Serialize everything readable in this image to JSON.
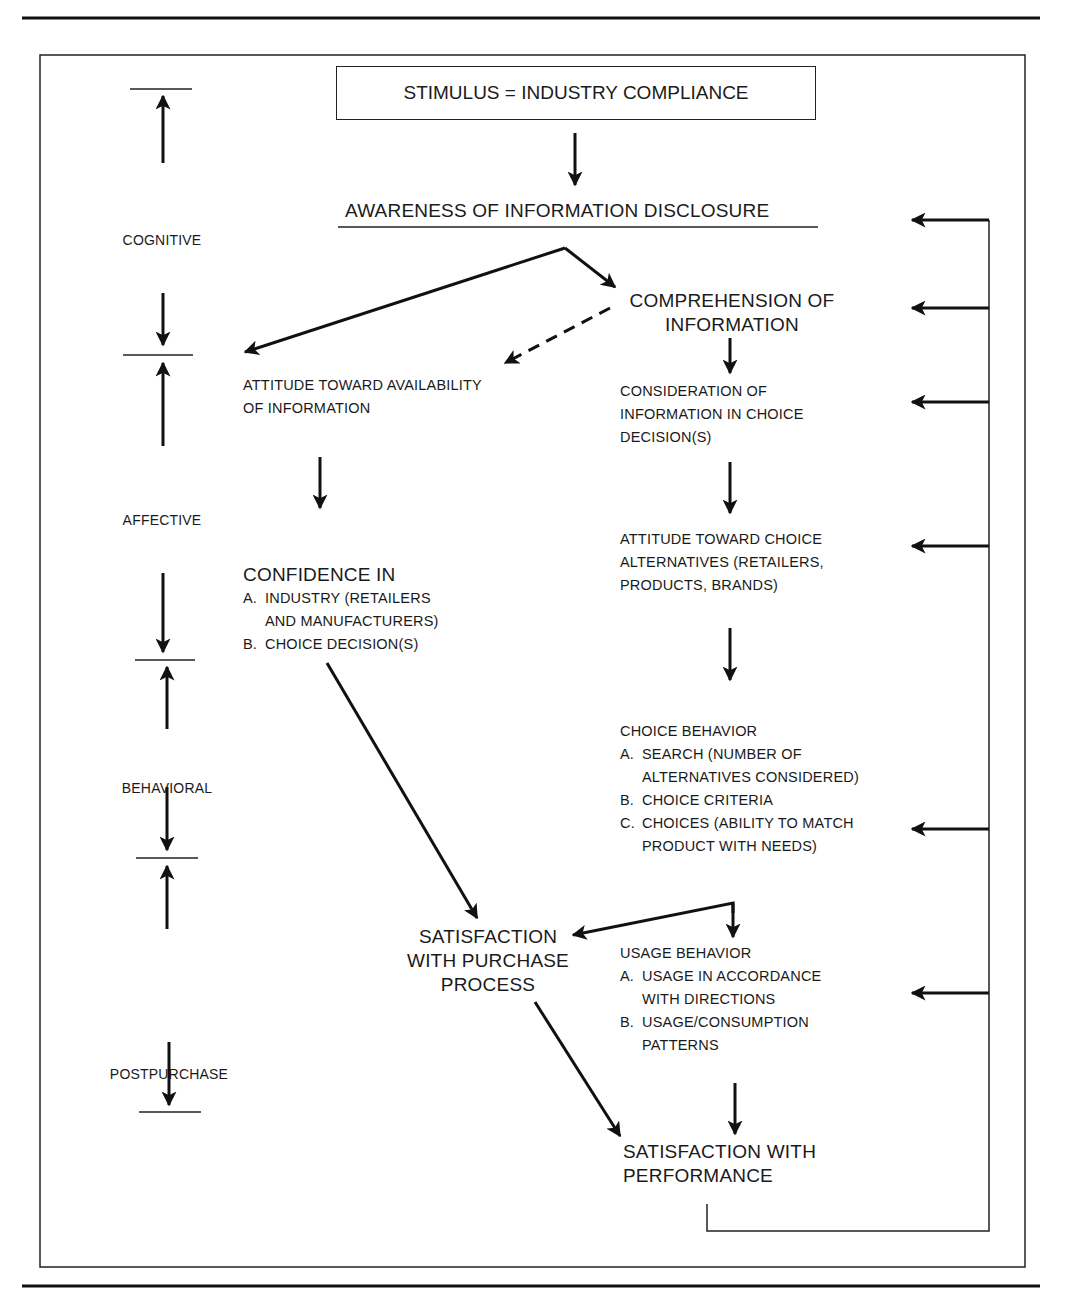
{
  "figure": {
    "stimulus": "STIMULUS = INDUSTRY COMPLIANCE",
    "awareness": "AWARENESS OF INFORMATION DISCLOSURE",
    "comprehension": [
      "COMPREHENSION OF",
      "INFORMATION"
    ],
    "attitude_availability": [
      "ATTITUDE TOWARD AVAILABILITY",
      "OF INFORMATION"
    ],
    "consideration": [
      "CONSIDERATION OF",
      "INFORMATION IN CHOICE",
      "DECISION(S)"
    ],
    "attitude_choice": [
      "ATTITUDE TOWARD CHOICE",
      "ALTERNATIVES (RETAILERS,",
      "PRODUCTS, BRANDS)"
    ],
    "confidence": {
      "title": "CONFIDENCE IN",
      "items": [
        {
          "marker": "A.",
          "lines": [
            "INDUSTRY (RETAILERS",
            "AND MANUFACTURERS)"
          ]
        },
        {
          "marker": "B.",
          "lines": [
            "CHOICE DECISION(S)"
          ]
        }
      ]
    },
    "choice_behavior": {
      "title": "CHOICE BEHAVIOR",
      "items": [
        {
          "marker": "A.",
          "lines": [
            "SEARCH (NUMBER OF",
            "ALTERNATIVES CONSIDERED)"
          ]
        },
        {
          "marker": "B.",
          "lines": [
            "CHOICE CRITERIA"
          ]
        },
        {
          "marker": "C.",
          "lines": [
            "CHOICES (ABILITY TO MATCH",
            "PRODUCT WITH NEEDS)"
          ]
        }
      ]
    },
    "satisfaction_purchase": [
      "SATISFACTION",
      "WITH PURCHASE",
      "PROCESS"
    ],
    "usage_behavior": {
      "title": "USAGE BEHAVIOR",
      "items": [
        {
          "marker": "A.",
          "lines": [
            "USAGE IN ACCORDANCE",
            "WITH DIRECTIONS"
          ]
        },
        {
          "marker": "B.",
          "lines": [
            "USAGE/CONSUMPTION",
            "PATTERNS"
          ]
        }
      ]
    },
    "satisfaction_performance": [
      "SATISFACTION WITH",
      "PERFORMANCE"
    ],
    "stages": [
      "COGNITIVE",
      "AFFECTIVE",
      "BEHAVIORAL",
      "POSTPURCHASE"
    ]
  }
}
